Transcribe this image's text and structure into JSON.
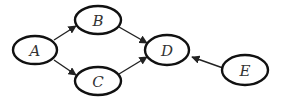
{
  "diagram": {
    "type": "directed-graph",
    "nodes": [
      {
        "id": "A",
        "label": "A",
        "cx": 35,
        "cy": 50
      },
      {
        "id": "B",
        "label": "B",
        "cx": 98,
        "cy": 20
      },
      {
        "id": "C",
        "label": "C",
        "cx": 98,
        "cy": 81
      },
      {
        "id": "D",
        "label": "D",
        "cx": 167,
        "cy": 50
      },
      {
        "id": "E",
        "label": "E",
        "cx": 245,
        "cy": 70
      }
    ],
    "edges": [
      {
        "from": "A",
        "to": "B"
      },
      {
        "from": "A",
        "to": "C"
      },
      {
        "from": "B",
        "to": "D"
      },
      {
        "from": "C",
        "to": "D"
      },
      {
        "from": "E",
        "to": "D"
      }
    ]
  }
}
